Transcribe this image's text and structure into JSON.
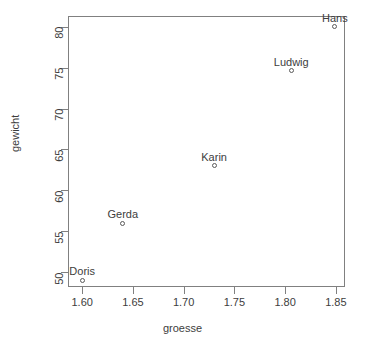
{
  "chart_data": {
    "type": "scatter",
    "title": "",
    "xlabel": "groesse",
    "ylabel": "gewicht",
    "xlim": [
      1.586,
      1.859
    ],
    "ylim": [
      48.2,
      81.3
    ],
    "grid": false,
    "legend": "none",
    "marker": "open-circle",
    "xticks": [
      "1.60",
      "1.65",
      "1.70",
      "1.75",
      "1.80",
      "1.85"
    ],
    "xtick_values": [
      1.6,
      1.65,
      1.7,
      1.75,
      1.8,
      1.85
    ],
    "yticks": [
      "50",
      "55",
      "60",
      "65",
      "70",
      "75",
      "80"
    ],
    "ytick_values": [
      50,
      55,
      60,
      65,
      70,
      75,
      80
    ],
    "points": [
      {
        "label": "Doris",
        "x": 1.6,
        "y": 49.0
      },
      {
        "label": "Gerda",
        "x": 1.64,
        "y": 56.0
      },
      {
        "label": "Karin",
        "x": 1.73,
        "y": 63.0
      },
      {
        "label": "Ludwig",
        "x": 1.806,
        "y": 74.6
      },
      {
        "label": "Hans",
        "x": 1.849,
        "y": 80.0
      }
    ],
    "colors": {
      "axis": "#808080",
      "marker": "#5a5a5a",
      "text": "#3d3d3d",
      "background": "#ffffff"
    }
  }
}
